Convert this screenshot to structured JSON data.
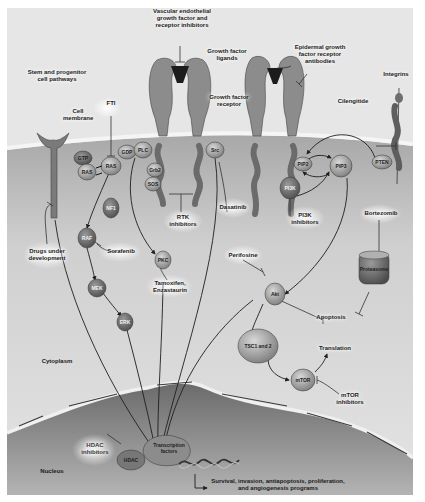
{
  "figure": {
    "regions": {
      "cytoplasm": "Cytoplasm",
      "nucleus": "Nucleus",
      "cell_membrane": "Cell\nmembrane"
    },
    "receptors": {
      "vegf_inhibitors": "Vascular endothelial\ngrowth factor and\nreceptor inhibitors",
      "growth_factor_ligands": "Growth factor\nligands",
      "growth_factor_receptor": "Growth factor\nreceptor",
      "egfr_antibodies": "Epidermal growth\nfactor receptor\nantibodies",
      "integrins": "Integrins",
      "cilengitide": "Cilengitide",
      "stem_pathways": "Stem and progenitor\ncell pathways"
    },
    "nodes": {
      "gtp": "GTP",
      "ras1": "RAS",
      "ras2": "RAS",
      "gdp": "GDP",
      "plc": "PLC",
      "grb2": "Grb2",
      "sos": "SOS",
      "src": "Src",
      "nf1": "NF1",
      "raf": "RAF",
      "mek": "MEK",
      "erk": "ERK",
      "pkc": "PKC",
      "pip2": "PIP2",
      "pip3": "PIP3",
      "pten": "PTEN",
      "pi3k": "PI3K",
      "akt": "Akt",
      "tsc": "TSC1 and 2",
      "mtor": "mTOR",
      "proteasome": "Proteasome",
      "hdac": "HDAC",
      "transcription_factors": "Transcription\nfactors"
    },
    "drugs": {
      "fti": "FTI",
      "sorafenib": "Sorafenib",
      "tamoxifen": "Tamoxifen,\nEnzastaurin",
      "rtk_inhibitors": "RTK\ninhibitors",
      "dasatinib": "Dasatinib",
      "pi3k_inhibitors": "PI3K\ninhibitors",
      "bortezomib": "Bortezomib",
      "perifosine": "Perifosine",
      "mtor_inhibitors": "mTOR\ninhibitors",
      "hdac_inhibitors": "HDAC\ninhibitors",
      "drugs_under_development": "Drugs under\ndevelopment"
    },
    "outcomes": {
      "apoptosis": "Apoptosis",
      "translation": "Translation",
      "programs": "Survival, invasion, antiapoptosis, proliferation,\nand angiogenesis programs"
    },
    "colors": {
      "background": "#e6e6e6",
      "cytoplasm": "#c9c9c9",
      "membrane": "#f4f4f4",
      "nucleus": "#8a8a8a",
      "receptor": "#8f8f8f",
      "node": "#9a9a9a",
      "node_dark": "#6e6e6e",
      "line": "#1e1e1e"
    }
  }
}
